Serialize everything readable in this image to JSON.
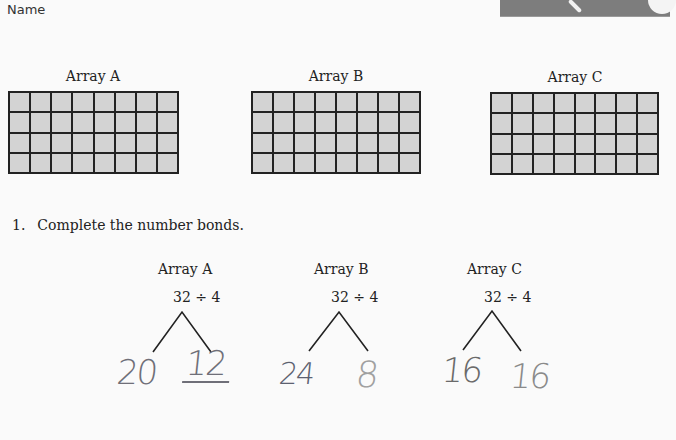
{
  "header": {
    "name_label": "Name"
  },
  "arrays": [
    {
      "title": "Array A",
      "rows": 4,
      "columns": 8
    },
    {
      "title": "Array B",
      "rows": 4,
      "columns": 8
    },
    {
      "title": "Array C",
      "rows": 4,
      "columns": 8
    }
  ],
  "question": {
    "number": "1.",
    "text": "Complete the number bonds."
  },
  "bonds": [
    {
      "title": "Array A",
      "expression": "32 ÷ 4",
      "left_answer": "20",
      "right_answer": "12",
      "left_color": "#6f6f78",
      "right_color": "#6f6f78"
    },
    {
      "title": "Array B",
      "expression": "32 ÷ 4",
      "left_answer": "24",
      "right_answer": "8",
      "left_color": "#5c6170",
      "right_color": "#a0a0a0"
    },
    {
      "title": "Array C",
      "expression": "32 ÷ 4",
      "left_answer": "16",
      "right_answer": "16",
      "left_color": "#6a6a6a",
      "right_color": "#8a8a8a"
    }
  ],
  "colors": {
    "cell_fill": "#d3d3d3",
    "grid_line": "#222222",
    "page_bg": "#fafafa"
  }
}
